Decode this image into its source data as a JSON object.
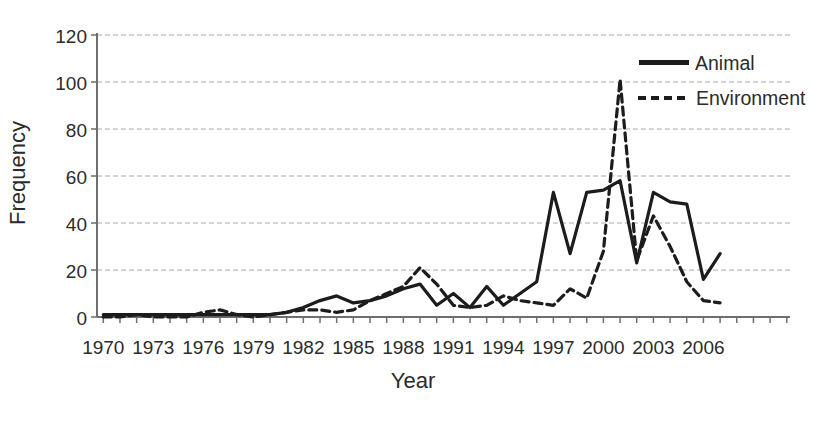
{
  "figure": {
    "ylabel": "Frequency",
    "xlabel": "Year"
  },
  "legend": {
    "items": [
      {
        "label": "Animal",
        "style": "solid"
      },
      {
        "label": "Environment",
        "style": "dashed"
      }
    ]
  },
  "chart_data": {
    "type": "line",
    "title": "",
    "xlabel": "Year",
    "ylabel": "Frequency",
    "ylim": [
      0,
      120
    ],
    "ytick_interval": 20,
    "grid": true,
    "legend_position": "top-right",
    "line_color": "#1c1c1c",
    "grid_color": "#aaaaaa",
    "axis_color": "#6e6e6e",
    "xtick_labels": [
      "1970",
      "1973",
      "1976",
      "1979",
      "1982",
      "1985",
      "1988",
      "1991",
      "1994",
      "1997",
      "2000",
      "2003",
      "2006"
    ],
    "x": [
      1970,
      1971,
      1972,
      1973,
      1974,
      1975,
      1976,
      1977,
      1978,
      1979,
      1980,
      1981,
      1982,
      1983,
      1984,
      1985,
      1986,
      1987,
      1988,
      1989,
      1990,
      1991,
      1992,
      1993,
      1994,
      1995,
      1996,
      1997,
      1998,
      1999,
      2000,
      2001,
      2002,
      2003,
      2004,
      2005,
      2006,
      2007
    ],
    "series": [
      {
        "name": "Animal",
        "style": "solid",
        "values": [
          1,
          1,
          1,
          1,
          1,
          1,
          1,
          1,
          1,
          1,
          1,
          2,
          4,
          7,
          9,
          6,
          7,
          9,
          12,
          14,
          5,
          10,
          4,
          13,
          5,
          10,
          15,
          53,
          27,
          53,
          54,
          58,
          23,
          53,
          49,
          48,
          16,
          27
        ]
      },
      {
        "name": "Environment",
        "style": "dashed",
        "values": [
          0,
          0,
          1,
          0,
          0,
          0,
          2,
          3,
          1,
          0,
          1,
          2,
          3,
          3,
          2,
          3,
          7,
          10,
          13,
          21,
          14,
          5,
          4,
          5,
          9,
          7,
          6,
          5,
          12,
          8,
          28,
          101,
          24,
          43,
          30,
          15,
          7,
          6
        ]
      }
    ]
  }
}
